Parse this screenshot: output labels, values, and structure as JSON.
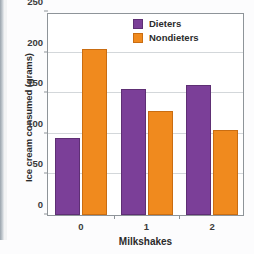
{
  "chart_data": {
    "type": "bar",
    "title": "",
    "xlabel": "Milkshakes",
    "ylabel": "Ice cream consumed (grams)",
    "categories": [
      "0",
      "1",
      "2"
    ],
    "series": [
      {
        "name": "Dieters",
        "color": "#7B3F98",
        "values": [
          95,
          155,
          160
        ]
      },
      {
        "name": "Nondieters",
        "color": "#F08A1E",
        "values": [
          205,
          128,
          105
        ]
      }
    ],
    "ylim": [
      0,
      250
    ],
    "yticks": [
      0,
      50,
      100,
      150,
      200,
      250
    ],
    "ytick_labels": [
      "0",
      "50",
      "100",
      "150",
      "200",
      "250"
    ],
    "grid": true,
    "legend_position": "top-right"
  },
  "legend": {
    "items": [
      {
        "label": "Dieters",
        "color": "#7B3F98"
      },
      {
        "label": "Nondieters",
        "color": "#F08A1E"
      }
    ]
  }
}
